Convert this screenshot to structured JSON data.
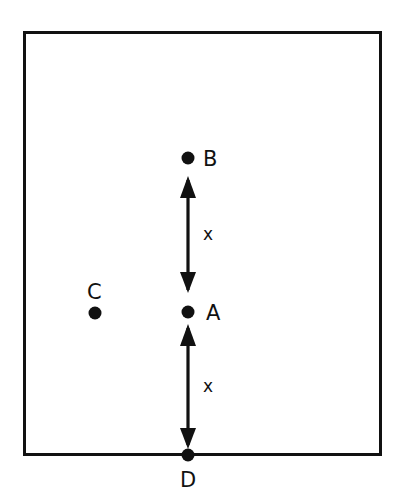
{
  "figure": {
    "title": "",
    "background_color": "#ffffff",
    "stroke_color": "#111111",
    "boundary": {
      "name": "rectangle-boundary",
      "x": 23,
      "y": 31,
      "width": 358,
      "height": 424,
      "stroke_width": 3
    }
  },
  "points": [
    {
      "id": "B",
      "label": "B",
      "cx": 188,
      "cy": 158,
      "r": 6.5,
      "label_x": 203,
      "label_y": 166
    },
    {
      "id": "A",
      "label": "A",
      "cx": 188,
      "cy": 312,
      "r": 6.5,
      "label_x": 206,
      "label_y": 320
    },
    {
      "id": "C",
      "label": "C",
      "cx": 95,
      "cy": 313,
      "r": 6.5,
      "label_x": 87,
      "label_y": 299
    },
    {
      "id": "D",
      "label": "D",
      "cx": 188,
      "cy": 455,
      "r": 6.5,
      "label_x": 180,
      "label_y": 487
    }
  ],
  "arrows": [
    {
      "id": "arrow-b-a",
      "name": "double-arrow-upper",
      "from": "A",
      "to": "B",
      "x": 188,
      "y_top": 178,
      "y_bottom": 292,
      "label": "x",
      "label_x": 203,
      "label_y": 240
    },
    {
      "id": "arrow-a-d",
      "name": "double-arrow-lower",
      "from": "D",
      "to": "A",
      "x": 188,
      "y_top": 325,
      "y_bottom": 447,
      "label": "x",
      "label_x": 203,
      "label_y": 392
    }
  ],
  "labels": {
    "point_b": "B",
    "point_a": "A",
    "point_c": "C",
    "point_d": "D",
    "distance_upper": "x",
    "distance_lower": "x"
  }
}
